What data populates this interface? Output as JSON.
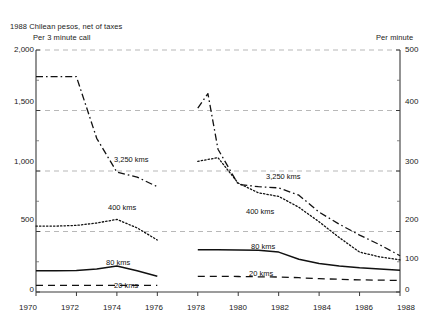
{
  "title": {
    "line1": "1988 Chilean pesos, net of taxes",
    "line2": "Per 3 minute call",
    "right_axis_title": "Per minute"
  },
  "axes": {
    "left_ticks": [
      "0",
      "500",
      "1,000",
      "1,500",
      "2,000"
    ],
    "right_ticks": [
      "0",
      "100",
      "200",
      "300",
      "400",
      "500"
    ],
    "x_ticks": [
      "1970",
      "1972",
      "1974",
      "1976",
      "1978",
      "1980",
      "1982",
      "1984",
      "1986",
      "1988"
    ]
  },
  "series_labels": {
    "left_3250": "3,250 kms",
    "left_400": "400 kms",
    "left_80": "80 kms",
    "left_20": "20 kms",
    "right_3250": "3,250 kms",
    "right_400": "400 kms",
    "right_80": "80 kms",
    "right_20": "20 kms"
  },
  "chart_data": {
    "type": "line",
    "title": "1988 Chilean pesos, net of taxes",
    "subtitle": "Per 3 minute call",
    "xlabel": "",
    "ylabel": "1988 Chilean pesos, net of taxes (per 3 minute call)",
    "ylabel_right": "Per minute",
    "xlim": [
      1970,
      1988
    ],
    "ylim": [
      0,
      2000
    ],
    "ylim_right": [
      0,
      500
    ],
    "yticks": [
      0,
      500,
      1000,
      1500,
      2000
    ],
    "yticks_right": [
      0,
      100,
      200,
      300,
      400,
      500
    ],
    "xticks": [
      1970,
      1972,
      1974,
      1976,
      1978,
      1980,
      1982,
      1984,
      1986,
      1988
    ],
    "grid": "horizontal-dashed",
    "legend": "inline-annotations",
    "data_gap_years": [
      1977
    ],
    "series": [
      {
        "name": "3,250 kms",
        "style": "dash-dot",
        "x": [
          1970,
          1971,
          1972,
          1973,
          1974,
          1975,
          1976,
          1977,
          1978,
          1978.5,
          1979,
          1980,
          1981,
          1982,
          1983,
          1984,
          1985,
          1986,
          1987,
          1988
        ],
        "values": [
          1780,
          1780,
          1780,
          1270,
          990,
          950,
          870,
          null,
          1520,
          1640,
          1180,
          890,
          870,
          860,
          800,
          660,
          560,
          470,
          390,
          300
        ]
      },
      {
        "name": "400 kms",
        "style": "dotted",
        "x": [
          1970,
          1971,
          1972,
          1973,
          1974,
          1975,
          1976,
          1977,
          1978,
          1979,
          1980,
          1981,
          1982,
          1983,
          1984,
          1985,
          1986,
          1987,
          1988
        ],
        "values": [
          545,
          545,
          550,
          570,
          600,
          530,
          430,
          null,
          1080,
          1110,
          900,
          820,
          790,
          700,
          580,
          450,
          330,
          290,
          265
        ]
      },
      {
        "name": "80 kms",
        "style": "solid",
        "x": [
          1970,
          1971,
          1972,
          1973,
          1974,
          1975,
          1976,
          1977,
          1978,
          1979,
          1980,
          1981,
          1982,
          1983,
          1984,
          1985,
          1986,
          1987,
          1988
        ],
        "values": [
          175,
          175,
          178,
          190,
          215,
          175,
          130,
          null,
          350,
          350,
          348,
          345,
          330,
          270,
          235,
          215,
          200,
          190,
          180
        ]
      },
      {
        "name": "20 kms",
        "style": "dashed",
        "x": [
          1970,
          1971,
          1972,
          1973,
          1974,
          1975,
          1976,
          1977,
          1978,
          1979,
          1980,
          1981,
          1982,
          1983,
          1984,
          1985,
          1986,
          1987,
          1988
        ],
        "values": [
          55,
          55,
          55,
          55,
          55,
          55,
          55,
          null,
          130,
          130,
          128,
          126,
          124,
          118,
          110,
          105,
          100,
          98,
          95
        ]
      }
    ]
  }
}
